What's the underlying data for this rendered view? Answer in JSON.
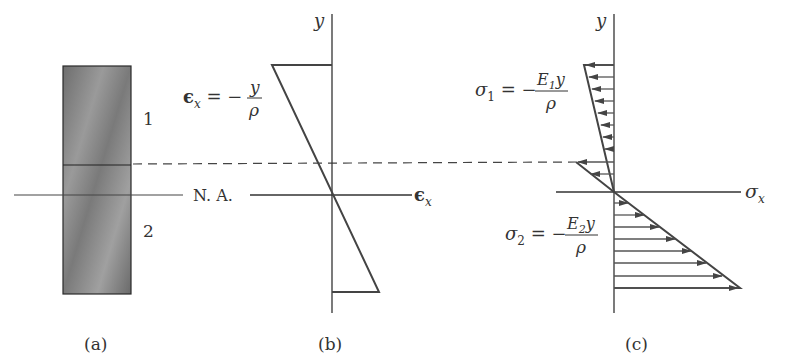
{
  "figure": {
    "panels": [
      {
        "id": "a",
        "caption": "(a)",
        "region_labels": [
          "1",
          "2"
        ]
      },
      {
        "id": "b",
        "caption": "(b)",
        "axis_y": "y",
        "axis_x": "ϵx",
        "formula": {
          "lhs": "ϵx = −",
          "numerator": "y",
          "denominator": "ρ"
        }
      },
      {
        "id": "c",
        "caption": "(c)",
        "axis_y": "y",
        "axis_x": "σx",
        "formula_top": {
          "lhs": "σ1 = −",
          "numerator": "E1y",
          "denominator": "ρ"
        },
        "formula_bottom": {
          "lhs": "σ2 = −",
          "numerator": "E2y",
          "denominator": "ρ"
        }
      }
    ],
    "neutral_axis_label": "N. A.",
    "colors": {
      "line": "#333333",
      "block_fill": "#8a8a8a",
      "block_edge": "#2a2a2a"
    }
  }
}
